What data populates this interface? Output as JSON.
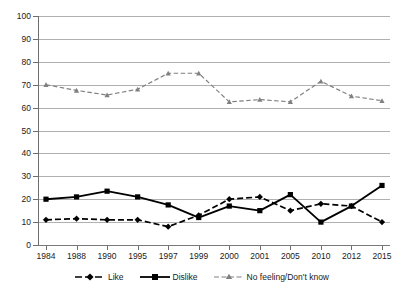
{
  "chart_data": {
    "type": "line",
    "title": "",
    "subtitle": "",
    "xlabel": "",
    "ylabel": "",
    "categories": [
      "1984",
      "1988",
      "1990",
      "1995",
      "1997",
      "1999",
      "2000",
      "2001",
      "2005",
      "2010",
      "2012",
      "2015"
    ],
    "ylim": [
      0,
      100
    ],
    "y_ticks": [
      0,
      10,
      20,
      30,
      40,
      50,
      60,
      70,
      80,
      90,
      100
    ],
    "grid": "horizontal",
    "legend_position": "bottom",
    "series": [
      {
        "name": "Like",
        "style": "dashed",
        "marker": "diamond",
        "color": "#000000",
        "values": [
          11,
          11.5,
          11,
          11,
          8,
          13,
          20,
          21,
          15,
          18,
          17,
          10
        ]
      },
      {
        "name": "Dislike",
        "style": "solid",
        "marker": "square",
        "color": "#000000",
        "values": [
          20,
          21,
          23.5,
          21,
          17.5,
          12,
          17,
          15,
          22,
          10,
          17,
          26
        ]
      },
      {
        "name": "No feeling/Don't know",
        "style": "dashed",
        "marker": "triangle",
        "color": "#808080",
        "values": [
          70,
          67.5,
          65.5,
          68,
          75,
          75,
          62.5,
          63.5,
          62.5,
          71.5,
          65,
          63
        ]
      }
    ]
  },
  "axes": {
    "y_tick_labels": [
      "100",
      "90",
      "80",
      "70",
      "60",
      "50",
      "40",
      "30",
      "20",
      "10",
      "0"
    ],
    "x_tick_labels": [
      "1984",
      "1988",
      "1990",
      "1995",
      "1997",
      "1999",
      "2000",
      "2001",
      "2005",
      "2010",
      "2012",
      "2015"
    ]
  },
  "legend": {
    "items": [
      {
        "label": "Like"
      },
      {
        "label": "Dislike"
      },
      {
        "label": "No feeling/Don't know"
      }
    ]
  },
  "colors": {
    "series_like": "#000000",
    "series_dislike": "#000000",
    "series_nofeeling": "#808080",
    "grid": "#b0b0b0",
    "axis": "#6e6e6e",
    "background": "#ffffff"
  }
}
